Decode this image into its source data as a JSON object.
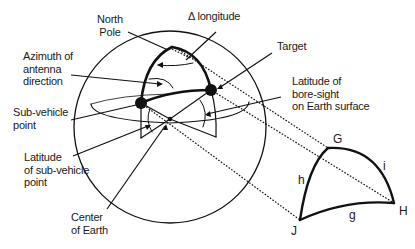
{
  "diagram": {
    "type": "spherical-geometry",
    "colors": {
      "stroke": "#111111",
      "background": "#ffffff",
      "text": "#1a1a1a"
    },
    "labels": {
      "north_pole": [
        "North",
        "Pole"
      ],
      "delta_longitude": "Δ longitude",
      "target": "Target",
      "azimuth": [
        "Azimuth of",
        "antenna",
        "direction"
      ],
      "latitude_boresight": [
        "Latitude of",
        "bore-sight",
        "on Earth surface"
      ],
      "sub_vehicle_point": [
        "Sub-vehicle",
        "point"
      ],
      "latitude_sub_vehicle": [
        "Latitude",
        "of sub-vehicle",
        "point"
      ],
      "center_of_earth": [
        "Center",
        "of Earth"
      ]
    },
    "triangle": {
      "vertices": {
        "G": "G",
        "H": "H",
        "J": "J"
      },
      "sides": {
        "h": "h",
        "i": "i",
        "g": "g"
      }
    }
  }
}
